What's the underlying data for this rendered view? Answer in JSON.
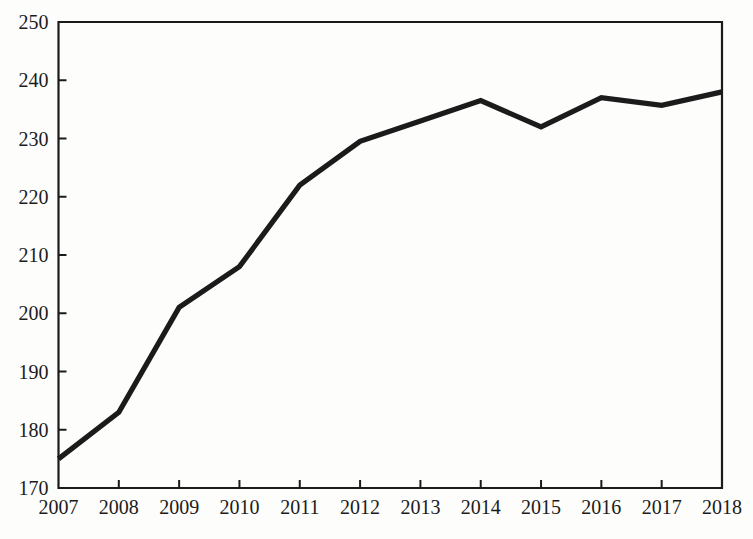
{
  "chart_data": {
    "type": "line",
    "title": "",
    "subtitle": "",
    "xlabel": "",
    "ylabel": "",
    "categories": [
      "2007",
      "2008",
      "2009",
      "2010",
      "2011",
      "2012",
      "2013",
      "2014",
      "2015",
      "2016",
      "2017",
      "2018"
    ],
    "x": [
      2007,
      2008,
      2009,
      2010,
      2011,
      2012,
      2013,
      2014,
      2015,
      2016,
      2017,
      2018
    ],
    "values": [
      175,
      183,
      201,
      208,
      222,
      229.5,
      233,
      236.5,
      232,
      237,
      235.7,
      238
    ],
    "series": [
      {
        "name": "",
        "values": [
          175,
          183,
          201,
          208,
          222,
          229.5,
          233,
          236.5,
          232,
          237,
          235.7,
          238
        ]
      }
    ],
    "xlim": [
      2007,
      2018
    ],
    "ylim": [
      170,
      250
    ],
    "yticks": [
      170,
      180,
      190,
      200,
      210,
      220,
      230,
      240,
      250
    ],
    "ytick_labels": [
      "170",
      "180",
      "190",
      "200",
      "210",
      "220",
      "230",
      "240",
      "250"
    ],
    "xticks": [
      2007,
      2008,
      2009,
      2010,
      2011,
      2012,
      2013,
      2014,
      2015,
      2016,
      2017,
      2018
    ],
    "xtick_labels": [
      "2007",
      "2008",
      "2009",
      "2010",
      "2011",
      "2012",
      "2013",
      "2014",
      "2015",
      "2016",
      "2017",
      "2018"
    ],
    "grid": false,
    "legend": null,
    "legend_position": "none",
    "annotations": [],
    "line_color": "#1b1b1b",
    "axis_color": "#1b1b1b",
    "background_color": "#fdfdfc"
  }
}
